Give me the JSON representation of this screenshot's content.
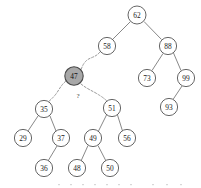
{
  "diagram": {
    "type": "binary-search-tree",
    "title": "",
    "annotation": "?",
    "colors": {
      "node_fill": "#ffffff",
      "node_stroke": "#555555",
      "highlight_fill": "#a8a8a8",
      "edge": "#6a6a6a",
      "dashed_edge": "#9a9a9a",
      "label": "#1a1a1a"
    },
    "nodes": [
      {
        "id": "n62",
        "label": "62",
        "x": 137,
        "y": 15,
        "r": 9.0,
        "highlight": false
      },
      {
        "id": "n58",
        "label": "58",
        "x": 107,
        "y": 46,
        "r": 8.6,
        "highlight": false
      },
      {
        "id": "n88",
        "label": "88",
        "x": 168,
        "y": 46,
        "r": 8.6,
        "highlight": false
      },
      {
        "id": "n73",
        "label": "73",
        "x": 147,
        "y": 78,
        "r": 8.6,
        "highlight": false
      },
      {
        "id": "n99",
        "label": "99",
        "x": 186,
        "y": 78,
        "r": 8.6,
        "highlight": false
      },
      {
        "id": "n93",
        "label": "93",
        "x": 169,
        "y": 107,
        "r": 8.6,
        "highlight": false
      },
      {
        "id": "n47",
        "label": "47",
        "x": 74,
        "y": 76,
        "r": 9.2,
        "highlight": true
      },
      {
        "id": "n35",
        "label": "35",
        "x": 44,
        "y": 109,
        "r": 8.6,
        "highlight": false
      },
      {
        "id": "n29",
        "label": "29",
        "x": 23,
        "y": 138,
        "r": 8.6,
        "highlight": false
      },
      {
        "id": "n37",
        "label": "37",
        "x": 61,
        "y": 138,
        "r": 8.6,
        "highlight": false
      },
      {
        "id": "n36",
        "label": "36",
        "x": 44,
        "y": 168,
        "r": 8.6,
        "highlight": false
      },
      {
        "id": "n51",
        "label": "51",
        "x": 112,
        "y": 108,
        "r": 8.6,
        "highlight": false
      },
      {
        "id": "n49",
        "label": "49",
        "x": 93,
        "y": 138,
        "r": 8.6,
        "highlight": false
      },
      {
        "id": "n56",
        "label": "56",
        "x": 127,
        "y": 138,
        "r": 8.6,
        "highlight": false
      },
      {
        "id": "n48",
        "label": "48",
        "x": 77,
        "y": 168,
        "r": 8.6,
        "highlight": false
      },
      {
        "id": "n50",
        "label": "50",
        "x": 110,
        "y": 168,
        "r": 8.6,
        "highlight": false
      }
    ],
    "edges": [
      {
        "from": "n62",
        "to": "n58",
        "style": "solid"
      },
      {
        "from": "n62",
        "to": "n88",
        "style": "solid"
      },
      {
        "from": "n88",
        "to": "n73",
        "style": "solid"
      },
      {
        "from": "n88",
        "to": "n99",
        "style": "solid"
      },
      {
        "from": "n99",
        "to": "n93",
        "style": "solid"
      },
      {
        "from": "n35",
        "to": "n29",
        "style": "solid"
      },
      {
        "from": "n35",
        "to": "n37",
        "style": "solid"
      },
      {
        "from": "n37",
        "to": "n36",
        "style": "solid"
      },
      {
        "from": "n51",
        "to": "n49",
        "style": "solid"
      },
      {
        "from": "n51",
        "to": "n56",
        "style": "solid"
      },
      {
        "from": "n49",
        "to": "n48",
        "style": "solid"
      },
      {
        "from": "n49",
        "to": "n50",
        "style": "solid"
      }
    ],
    "dashed_edges": [
      {
        "from": "n58",
        "to": "n47",
        "label": ""
      },
      {
        "from": "n47",
        "to": "n35",
        "label": ""
      },
      {
        "from": "n47",
        "to": "n51",
        "label": ""
      }
    ],
    "annotations": [
      {
        "text": "?",
        "x": 78,
        "y": 96
      }
    ]
  }
}
